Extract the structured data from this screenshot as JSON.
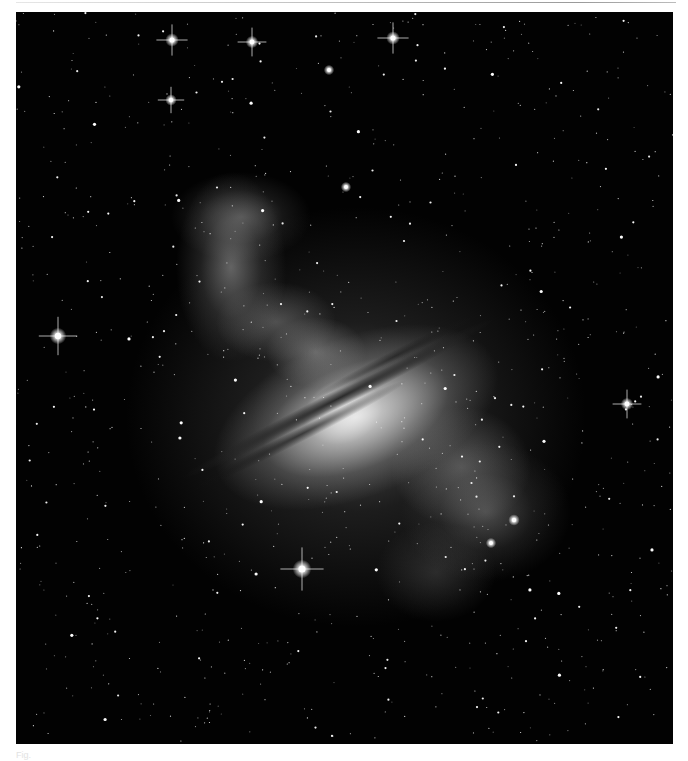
{
  "figure": {
    "tone": "grayscale",
    "background_color": "#020202",
    "page_background": "#ffffff",
    "caption_text": "Fig. "
  },
  "bright_stars": [
    {
      "x": 156,
      "y": 28,
      "r": 2.6,
      "spikes": true
    },
    {
      "x": 236,
      "y": 30,
      "r": 2.4,
      "spikes": true
    },
    {
      "x": 377,
      "y": 26,
      "r": 2.6,
      "spikes": true
    },
    {
      "x": 155,
      "y": 88,
      "r": 2.2,
      "spikes": true
    },
    {
      "x": 313,
      "y": 58,
      "r": 2.0,
      "spikes": false
    },
    {
      "x": 330,
      "y": 175,
      "r": 2.0,
      "spikes": false
    },
    {
      "x": 42,
      "y": 324,
      "r": 3.2,
      "spikes": true
    },
    {
      "x": 286,
      "y": 557,
      "r": 3.6,
      "spikes": true
    },
    {
      "x": 611,
      "y": 392,
      "r": 2.4,
      "spikes": true
    },
    {
      "x": 498,
      "y": 508,
      "r": 2.2,
      "spikes": false
    },
    {
      "x": 475,
      "y": 531,
      "r": 2.0,
      "spikes": false
    }
  ]
}
